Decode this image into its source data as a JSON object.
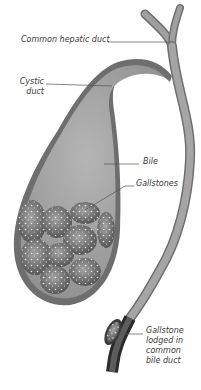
{
  "diagram": {
    "type": "anatomical-illustration",
    "labels": {
      "common_hepatic_duct": "Common hepatic duct",
      "cystic_duct": "Cystic\nduct",
      "bile": "Bile",
      "gallstones": "Gallstones",
      "gallstone_lodged": "Gallstone\nlodged in\ncommon\nbile duct"
    },
    "colors": {
      "wall": "#7a7a7a",
      "bile": "#a9a9a9",
      "stone": "#8c8c8c",
      "stone_speckle": "#e6e6e6",
      "leader_line": "#555555",
      "text": "#3a3a3a"
    }
  }
}
